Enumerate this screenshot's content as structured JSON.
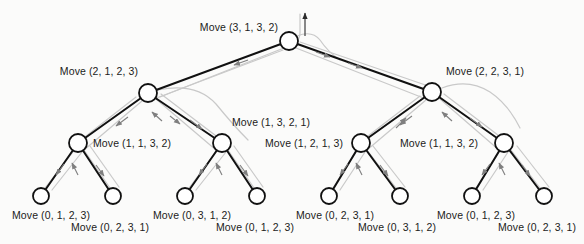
{
  "figure": {
    "type": "recursive-call-tree",
    "background_color": "#fbfbfa",
    "node_fill": "#ffffff",
    "node_stroke": "#111111",
    "edge_color": "#111111",
    "traversal_path_color": "#c9c9c9",
    "traversal_arrow_color": "#8e8e8e",
    "label_color": "#1b1b1b",
    "node_radius": 9,
    "leaf_radius": 8
  },
  "nodes": {
    "root": {
      "id": "n0",
      "x": 289,
      "y": 41,
      "depth": 0,
      "label": "Move (3, 1, 3, 2)"
    },
    "level1": [
      {
        "id": "n1",
        "x": 148,
        "y": 93,
        "depth": 1,
        "label": "Move (2, 1, 2, 3)"
      },
      {
        "id": "n2",
        "x": 432,
        "y": 92,
        "depth": 1,
        "label": "Move (2, 2, 3, 1)"
      }
    ],
    "level2": [
      {
        "id": "n3",
        "x": 78,
        "y": 143,
        "depth": 2,
        "label": "Move (1, 1, 3, 2)"
      },
      {
        "id": "n4",
        "x": 222,
        "y": 143,
        "depth": 2,
        "label": "Move (1, 3, 2, 1)"
      },
      {
        "id": "n5",
        "x": 361,
        "y": 143,
        "depth": 2,
        "label": "Move (1, 2, 1, 3)"
      },
      {
        "id": "n6",
        "x": 504,
        "y": 143,
        "depth": 2,
        "label": "Move (1, 1, 3, 2)"
      }
    ],
    "leaves": [
      {
        "id": "n7",
        "x": 41,
        "y": 196,
        "depth": 3,
        "label": "Move (0, 1, 2, 3)"
      },
      {
        "id": "n8",
        "x": 113,
        "y": 196,
        "depth": 3,
        "label": "Move (0, 2, 3, 1)"
      },
      {
        "id": "n9",
        "x": 185,
        "y": 196,
        "depth": 3,
        "label": "Move (0, 3, 1, 2)"
      },
      {
        "id": "n10",
        "x": 257,
        "y": 196,
        "depth": 3,
        "label": "Move (0, 1, 2, 3)"
      },
      {
        "id": "n11",
        "x": 329,
        "y": 196,
        "depth": 3,
        "label": "Move (0, 2, 3, 1)"
      },
      {
        "id": "n12",
        "x": 400,
        "y": 196,
        "depth": 3,
        "label": "Move (0, 3, 1, 2)"
      },
      {
        "id": "n13",
        "x": 472,
        "y": 196,
        "depth": 3,
        "label": "Move (0, 1, 2, 3)"
      },
      {
        "id": "n14",
        "x": 544,
        "y": 196,
        "depth": 3,
        "label": "Move (0, 2, 3, 1)"
      }
    ]
  },
  "labels": [
    {
      "name": "label-root",
      "text": "Move (3, 1, 3, 2)",
      "x": 278,
      "y": 27,
      "anchor": "end"
    },
    {
      "name": "label-n1",
      "text": "Move (2, 1, 2, 3)",
      "x": 138,
      "y": 71,
      "anchor": "end"
    },
    {
      "name": "label-n2",
      "text": "Move (2, 2, 3, 1)",
      "x": 446,
      "y": 71,
      "anchor": "start"
    },
    {
      "name": "label-n3",
      "text": "Move (1, 1, 3, 2)",
      "x": 93,
      "y": 139,
      "anchor": "start"
    },
    {
      "name": "label-n4",
      "text": "Move (1, 3, 2, 1)",
      "x": 232,
      "y": 118,
      "anchor": "start"
    },
    {
      "name": "label-n5",
      "text": "Move (1, 2, 1, 3)",
      "x": 265,
      "y": 139,
      "anchor": "start"
    },
    {
      "name": "label-n6",
      "text": "Move (1, 1, 3, 2)",
      "x": 400,
      "y": 139,
      "anchor": "start"
    },
    {
      "name": "label-leaf-1",
      "text": "Move (0, 1, 2, 3)",
      "x": 12,
      "y": 211,
      "anchor": "start"
    },
    {
      "name": "label-leaf-2",
      "text": "Move (0, 2, 3, 1)",
      "x": 71,
      "y": 223,
      "anchor": "start"
    },
    {
      "name": "label-leaf-3",
      "text": "Move (0, 3, 1, 2)",
      "x": 153,
      "y": 211,
      "anchor": "start"
    },
    {
      "name": "label-leaf-4",
      "text": "Move (0, 1, 2, 3)",
      "x": 216,
      "y": 223,
      "anchor": "start"
    },
    {
      "name": "label-leaf-5",
      "text": "Move (0, 2, 3, 1)",
      "x": 296,
      "y": 211,
      "anchor": "start"
    },
    {
      "name": "label-leaf-6",
      "text": "Move (0, 3, 1, 2)",
      "x": 358,
      "y": 223,
      "anchor": "start"
    },
    {
      "name": "label-leaf-7",
      "text": "Move (0, 1, 2, 3)",
      "x": 437,
      "y": 211,
      "anchor": "start"
    },
    {
      "name": "label-leaf-8",
      "text": "Move (0, 2, 3, 1)",
      "x": 498,
      "y": 223,
      "anchor": "start"
    }
  ],
  "edges": [
    {
      "from": "n0",
      "to": "n1"
    },
    {
      "from": "n0",
      "to": "n2"
    },
    {
      "from": "n1",
      "to": "n3"
    },
    {
      "from": "n1",
      "to": "n4"
    },
    {
      "from": "n2",
      "to": "n5"
    },
    {
      "from": "n2",
      "to": "n6"
    },
    {
      "from": "n3",
      "to": "n7"
    },
    {
      "from": "n3",
      "to": "n8"
    },
    {
      "from": "n4",
      "to": "n9"
    },
    {
      "from": "n4",
      "to": "n10"
    },
    {
      "from": "n5",
      "to": "n11"
    },
    {
      "from": "n5",
      "to": "n12"
    },
    {
      "from": "n6",
      "to": "n13"
    },
    {
      "from": "n6",
      "to": "n14"
    }
  ],
  "annotations": {
    "entry_arrow": {
      "name": "entry-arrow",
      "x": 305,
      "y_from": 36,
      "y_to": 12,
      "direction": "up"
    }
  }
}
